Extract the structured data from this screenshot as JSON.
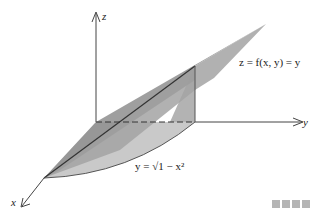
{
  "figure": {
    "type": "3d-surface-diagram",
    "axes": {
      "z_label": "z",
      "y_label": "y",
      "x_label": "x"
    },
    "labels": {
      "surface": "z = f(x, y) = y",
      "curve": "y = √1 − x²"
    },
    "colors": {
      "plane_light": "#9c9c9c",
      "plane_dark": "#7a7a7a",
      "region_base": "#c9c9c9",
      "side_wall": "#b3b3b3",
      "axis": "#444444",
      "footer_dots": "#b5b5b5"
    },
    "footer_dots_count": 4
  }
}
